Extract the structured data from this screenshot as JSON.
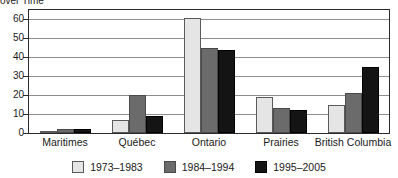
{
  "title": "over Time",
  "chart_data": {
    "type": "bar",
    "title": "over Time",
    "subtitle": "",
    "xlabel": "",
    "ylabel": "",
    "categories": [
      "Maritimes",
      "Québec",
      "Ontario",
      "Prairies",
      "British Columbia"
    ],
    "series": [
      {
        "name": "1973–1983",
        "color": "#e5e5e5",
        "values": [
          1,
          7,
          61,
          19,
          15
        ]
      },
      {
        "name": "1984–1994",
        "color": "#6b6b6b",
        "values": [
          2,
          20,
          45,
          13,
          21
        ]
      },
      {
        "name": "1995–2005",
        "color": "#141414",
        "values": [
          2,
          9,
          44,
          12,
          35
        ]
      }
    ],
    "ylim": [
      0,
      65
    ],
    "yticks": [
      0,
      10,
      20,
      30,
      40,
      50,
      60
    ],
    "ytick_labels": [
      "0",
      "10",
      "20",
      "30",
      "40",
      "50",
      "60"
    ],
    "grid": true,
    "grid_axis": "y",
    "legend_position": "bottom",
    "annotations": []
  },
  "legend": {
    "items": [
      {
        "label": "1973–1983",
        "color": "#e5e5e5"
      },
      {
        "label": "1984–1994",
        "color": "#6b6b6b"
      },
      {
        "label": "1995–2005",
        "color": "#141414"
      }
    ]
  },
  "colors": {
    "series_1": "#e5e5e5",
    "series_2": "#6b6b6b",
    "series_3": "#141414",
    "axis": "#2a2a2a",
    "gridline": "#8d8d8d",
    "background": "#ffffff",
    "text": "#1a1a1a"
  }
}
